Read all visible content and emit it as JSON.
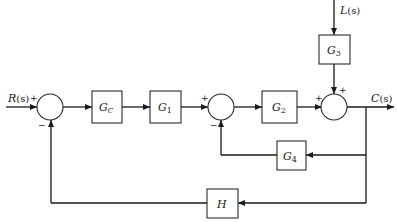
{
  "diagram": {
    "type": "control-system-block-diagram",
    "signals": {
      "input": {
        "name": "R",
        "arg": "(s)"
      },
      "output": {
        "name": "C",
        "arg": "(s)"
      },
      "disturbance": {
        "name": "L",
        "arg": "(s)"
      }
    },
    "blocks": [
      {
        "id": "Gc",
        "name": "G",
        "sub": "C",
        "sub_italic": true
      },
      {
        "id": "G1",
        "name": "G",
        "sub": "1",
        "sub_italic": false
      },
      {
        "id": "G2",
        "name": "G",
        "sub": "2",
        "sub_italic": false
      },
      {
        "id": "G3",
        "name": "G",
        "sub": "3",
        "sub_italic": false
      },
      {
        "id": "G4",
        "name": "G",
        "sub": "4",
        "sub_italic": false
      },
      {
        "id": "H",
        "name": "H",
        "sub": "",
        "sub_italic": false
      }
    ],
    "summing_junctions": [
      {
        "id": "S1",
        "signs": {
          "left": "+",
          "bottom": "−"
        }
      },
      {
        "id": "S2",
        "signs": {
          "left": "+",
          "bottom": "−"
        }
      },
      {
        "id": "S3",
        "signs": {
          "left": "+",
          "top": "+"
        }
      }
    ],
    "connections": [
      "R(s) → S1 (+)",
      "S1 → Gc",
      "Gc → G1",
      "G1 → S2 (+)",
      "S2 → G2",
      "G2 → S3 (+)",
      "L(s) → G3",
      "G3 → S3 (+)",
      "S3 → C(s)",
      "C(s) → G4 → S2 (−)",
      "C(s) → H → S1 (−)"
    ]
  }
}
